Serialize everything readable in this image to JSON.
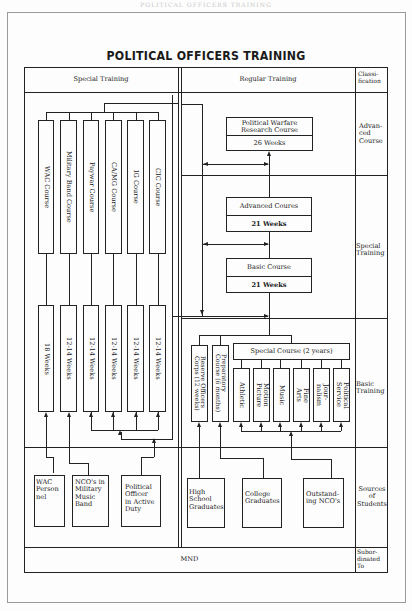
{
  "page": {
    "running_header": "POLITICAL OFFICERS TRAINING",
    "title": "POLITICAL OFFICERS TRAINING"
  },
  "table": {
    "headers": {
      "special_training": "Special Training",
      "regular_training": "Regular Training",
      "classification": "Classi-\nfication"
    },
    "classification_rows": [
      {
        "id": "advanced",
        "label": "Advan-\nced\nCourse"
      },
      {
        "id": "special",
        "label": "Special\nTraining"
      },
      {
        "id": "basic",
        "label": "Basic\nTraining"
      },
      {
        "id": "sources",
        "label": "Sources\nof\nStudents"
      },
      {
        "id": "subordinated",
        "label": "Subor-\ndinated\nTo"
      }
    ],
    "subordinated_to": "MND"
  },
  "special_training": {
    "courses": [
      {
        "name": "WAC Course",
        "duration": "18 Weeks"
      },
      {
        "name": "Military Band Course",
        "duration": "12-14 Weeks"
      },
      {
        "name": "Paywar Course",
        "duration": "12-14 Weeks"
      },
      {
        "name": "CA/MG Course",
        "duration": "12-14 Weeks"
      },
      {
        "name": "IG Course",
        "duration": "12-14 Weeks"
      },
      {
        "name": "CIC Course",
        "duration": "12-14 Weeks"
      }
    ],
    "sources": [
      {
        "label": "WAC\nPerson\nnel"
      },
      {
        "label": "NCO's in\nMilitary\nMusic\nBand"
      },
      {
        "label": "Political\nOfficer\nin Active\nDuty"
      }
    ]
  },
  "regular_training": {
    "political_warfare_research": {
      "name": "Political Warfare\nResearch Course",
      "duration": "26 Weeks"
    },
    "advanced_courses": {
      "name": "Advanced Coures",
      "duration": "21 Weeks"
    },
    "basic_course": {
      "name": "Basic Course",
      "duration": "21 Weeks"
    },
    "reserve_officers": "Reserve Officers\nCorps (12 weeks)",
    "preparatory_course": "Preparatory\nCourse (6 months)",
    "special_course": {
      "name": "Special Course (2 years)",
      "majors": [
        "Athletic",
        "Motion\nPicture",
        "Music",
        "Fine\nArts",
        "Jour-\nnalism",
        "Political\nService"
      ]
    },
    "sources": [
      {
        "label": "High\nSchool\nGraduates"
      },
      {
        "label": "College\nGraduates"
      },
      {
        "label": "Outstand-\ning NCO's"
      }
    ]
  }
}
